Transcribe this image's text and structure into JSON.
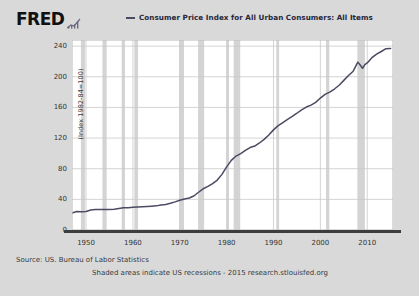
{
  "brand": {
    "logo_text": "FRED",
    "glyph_name": "mini-bar-chart-glyph"
  },
  "legend": {
    "series_label": "Consumer Price Index for All Urban Consumers: All Items",
    "dash_color": "#4a4a62"
  },
  "footer": {
    "source": "Source: US. Bureau of Labor Statistics",
    "note": "Shaded areas indicate US recessions - 2015 research.stlouisfed.org"
  },
  "theme": {
    "page_background": "#d9d9d9",
    "plot_background": "#ffffff",
    "line_color": "#4a4a62",
    "grid_color": "#c9c9c9",
    "recession_color": "#d4d4d4",
    "axis_color": "#3d3d3d",
    "text_color": "#333333"
  },
  "chart_data": {
    "type": "line",
    "title": "",
    "subtitle": "",
    "xlabel": "",
    "ylabel": "(Index 1982-84=100)",
    "xlim": [
      1947,
      2015.5
    ],
    "ylim": [
      0,
      248
    ],
    "grid": true,
    "legend_position": "top",
    "yticks": [
      240,
      200,
      160,
      120,
      80,
      40,
      0
    ],
    "ytick_labels": [
      "240",
      "200",
      "160",
      "120",
      "80",
      "40",
      "0"
    ],
    "xticks": [
      1950,
      1960,
      1970,
      1980,
      1990,
      2000,
      2010
    ],
    "xtick_labels": [
      "1950",
      "1960",
      "1970",
      "1980",
      "1990",
      "2000",
      "2010"
    ],
    "series": [
      {
        "name": "Consumer Price Index for All Urban Consumers: All Items",
        "color": "#4a4a62",
        "x": [
          1947,
          1948,
          1949,
          1950,
          1951,
          1952,
          1953,
          1954,
          1955,
          1956,
          1957,
          1958,
          1959,
          1960,
          1961,
          1962,
          1963,
          1964,
          1965,
          1966,
          1967,
          1968,
          1969,
          1970,
          1971,
          1972,
          1973,
          1974,
          1975,
          1976,
          1977,
          1978,
          1979,
          1980,
          1981,
          1982,
          1983,
          1984,
          1985,
          1986,
          1987,
          1988,
          1989,
          1990,
          1991,
          1992,
          1993,
          1994,
          1995,
          1996,
          1997,
          1998,
          1999,
          2000,
          2001,
          2002,
          2003,
          2004,
          2005,
          2006,
          2007,
          2008,
          2008.5,
          2009,
          2009.5,
          2010,
          2011,
          2012,
          2013,
          2014,
          2015
        ],
        "y": [
          22.3,
          24.1,
          23.8,
          24.1,
          26.0,
          26.6,
          26.8,
          26.9,
          26.8,
          27.2,
          28.1,
          28.9,
          29.2,
          29.6,
          29.9,
          30.3,
          30.6,
          31.0,
          31.5,
          32.5,
          33.4,
          34.8,
          36.7,
          38.8,
          40.5,
          41.8,
          44.4,
          49.3,
          53.8,
          56.9,
          60.6,
          65.2,
          72.6,
          82.4,
          90.9,
          96.5,
          99.6,
          103.9,
          107.6,
          109.6,
          113.6,
          118.3,
          124.0,
          130.7,
          136.2,
          140.3,
          144.5,
          148.2,
          152.4,
          156.9,
          160.5,
          163.0,
          166.6,
          172.2,
          177.1,
          179.9,
          184.0,
          188.9,
          195.3,
          201.6,
          207.3,
          219.1,
          215.3,
          211.1,
          215.9,
          218.1,
          224.9,
          229.6,
          233.0,
          236.7,
          237.0
        ],
        "annotations": [
          {
            "label": "2008-09 dip",
            "x": 2008.8,
            "y": 212
          }
        ]
      }
    ],
    "recession_bands": [
      {
        "start": 1948.9,
        "end": 1949.8
      },
      {
        "start": 1953.5,
        "end": 1954.4
      },
      {
        "start": 1957.6,
        "end": 1958.3
      },
      {
        "start": 1960.3,
        "end": 1961.1
      },
      {
        "start": 1969.9,
        "end": 1970.9
      },
      {
        "start": 1973.9,
        "end": 1975.2
      },
      {
        "start": 1980.0,
        "end": 1980.5
      },
      {
        "start": 1981.5,
        "end": 1982.9
      },
      {
        "start": 1990.6,
        "end": 1991.2
      },
      {
        "start": 2001.2,
        "end": 2001.9
      },
      {
        "start": 2007.9,
        "end": 2009.5
      }
    ]
  }
}
